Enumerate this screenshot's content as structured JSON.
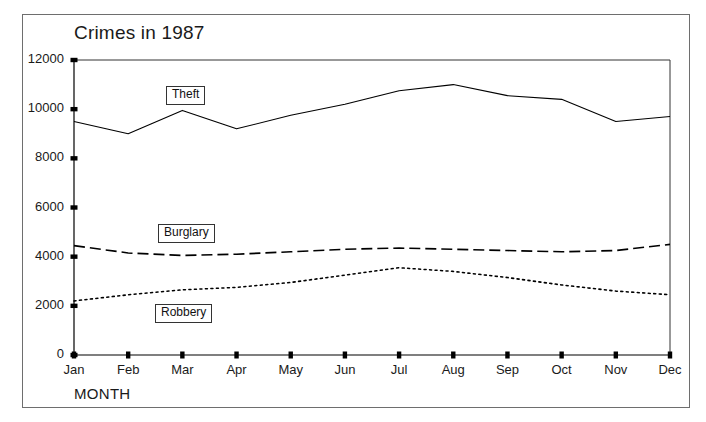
{
  "figure": {
    "title": "Crimes in 1987",
    "x_axis_title": "MONTH",
    "frame_color": "#6e6e6e"
  },
  "chart_data": {
    "type": "line",
    "title": "Crimes in 1987",
    "xlabel": "MONTH",
    "ylabel": "",
    "grid": false,
    "legend_position": "inline-labels",
    "xlim": [
      "Jan",
      "Dec"
    ],
    "ylim": [
      0,
      12000
    ],
    "yticks": [
      0,
      2000,
      4000,
      6000,
      8000,
      10000,
      12000
    ],
    "ytick_labels": [
      "0",
      "2000",
      "4000",
      "6000",
      "8000",
      "10000",
      "12000"
    ],
    "categories": [
      "Jan",
      "Feb",
      "Mar",
      "Apr",
      "May",
      "Jun",
      "Jul",
      "Aug",
      "Sep",
      "Oct",
      "Nov",
      "Dec"
    ],
    "series": [
      {
        "name": "Theft",
        "style": "solid",
        "color": "#000000",
        "values": [
          9500,
          9000,
          9950,
          9200,
          9750,
          10200,
          10750,
          11000,
          10550,
          10400,
          9500,
          9700
        ]
      },
      {
        "name": "Burglary",
        "style": "dashed",
        "color": "#000000",
        "values": [
          4450,
          4150,
          4050,
          4100,
          4200,
          4300,
          4350,
          4300,
          4250,
          4200,
          4250,
          4500
        ]
      },
      {
        "name": "Robbery",
        "style": "dotted",
        "color": "#000000",
        "values": [
          2200,
          2450,
          2650,
          2750,
          2950,
          3250,
          3550,
          3400,
          3150,
          2850,
          2600,
          2450
        ]
      }
    ]
  },
  "y_tick_labels": [
    {
      "value": "12000"
    },
    {
      "value": "10000"
    },
    {
      "value": "8000"
    },
    {
      "value": "6000"
    },
    {
      "value": "4000"
    },
    {
      "value": "2000"
    },
    {
      "value": "0"
    }
  ],
  "x_tick_labels": [
    {
      "value": "Jan"
    },
    {
      "value": "Feb"
    },
    {
      "value": "Mar"
    },
    {
      "value": "Apr"
    },
    {
      "value": "May"
    },
    {
      "value": "Jun"
    },
    {
      "value": "Jul"
    },
    {
      "value": "Aug"
    },
    {
      "value": "Sep"
    },
    {
      "value": "Oct"
    },
    {
      "value": "Nov"
    },
    {
      "value": "Dec"
    }
  ],
  "series_labels": [
    {
      "value": "Theft"
    },
    {
      "value": "Burglary"
    },
    {
      "value": "Robbery"
    }
  ]
}
